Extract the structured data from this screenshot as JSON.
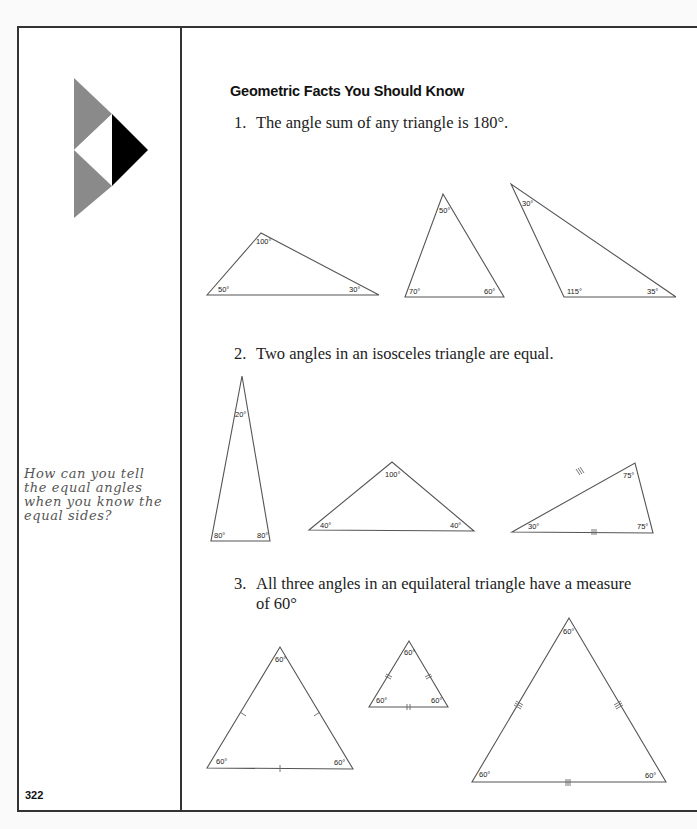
{
  "page": {
    "heading": "Geometric Facts You Should Know",
    "page_number": "322",
    "margin_note": "How can you tell the equal angles when you know the equal sides?",
    "logo": "triangle-logo-icon"
  },
  "facts": [
    {
      "num": "1.",
      "text": "The angle sum of any triangle is 180°."
    },
    {
      "num": "2.",
      "text": "Two angles in an isosceles triangle are equal."
    },
    {
      "num": "3.",
      "text": "All three angles in an equilateral triangle have a measure",
      "cont": "of 60°"
    }
  ],
  "figures": {
    "row1": [
      {
        "angles": [
          "100°",
          "50°",
          "30°"
        ]
      },
      {
        "angles": [
          "50°",
          "70°",
          "60°"
        ]
      },
      {
        "angles": [
          "30°",
          "115°",
          "35°"
        ]
      }
    ],
    "row2": [
      {
        "angles": [
          "20°",
          "80°",
          "80°"
        ]
      },
      {
        "angles": [
          "100°",
          "40°",
          "40°"
        ]
      },
      {
        "angles": [
          "75°",
          "30°",
          "75°"
        ]
      }
    ],
    "row3": [
      {
        "angles": [
          "60°",
          "60°",
          "60°"
        ]
      },
      {
        "angles": [
          "60°",
          "60°",
          "60°"
        ]
      },
      {
        "angles": [
          "60°",
          "60°",
          "60°"
        ]
      }
    ]
  }
}
